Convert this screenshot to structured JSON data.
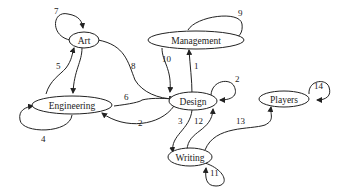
{
  "diagram": {
    "type": "directed-graph",
    "nodes": {
      "art": "Art",
      "management": "Management",
      "engineering": "Engineering",
      "design": "Design",
      "players": "Players",
      "writing": "Writing"
    },
    "edges": {
      "e1": {
        "label": "1",
        "from": "Design",
        "to": "Management"
      },
      "e2a": {
        "label": "2",
        "from": "Design",
        "to": "Design"
      },
      "e2b": {
        "label": "2",
        "from": "Design",
        "to": "Engineering"
      },
      "e3": {
        "label": "3",
        "from": "Design",
        "to": "Writing"
      },
      "e4": {
        "label": "4",
        "from": "Engineering",
        "to": "Engineering"
      },
      "e5": {
        "label": "5",
        "from": "Engineering",
        "to": "Art"
      },
      "e6": {
        "label": "6",
        "from": "Engineering",
        "to": "Design"
      },
      "e7": {
        "label": "7",
        "from": "Art",
        "to": "Art"
      },
      "e8": {
        "label": "8",
        "from": "Art",
        "to": "Design"
      },
      "e9": {
        "label": "9",
        "from": "Management",
        "to": "Management"
      },
      "e10": {
        "label": "10",
        "from": "Management",
        "to": "Design"
      },
      "e11": {
        "label": "11",
        "from": "Writing",
        "to": "Writing"
      },
      "e12": {
        "label": "12",
        "from": "Writing",
        "to": "Design"
      },
      "e13": {
        "label": "13",
        "from": "Writing",
        "to": "Players"
      },
      "e14": {
        "label": "14",
        "from": "Players",
        "to": "Players"
      }
    },
    "unlabeled_edges": [
      {
        "from": "Art",
        "to": "Engineering"
      }
    ]
  }
}
